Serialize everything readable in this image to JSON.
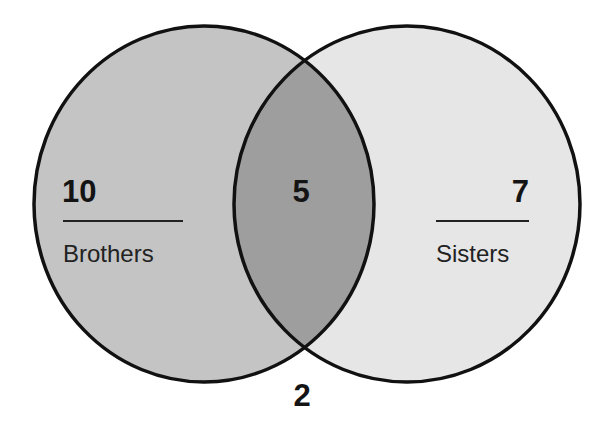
{
  "diagram": {
    "type": "venn",
    "sets": [
      {
        "id": "brothers",
        "label": "Brothers",
        "only_count": "10",
        "fill": "#c4c4c4"
      },
      {
        "id": "sisters",
        "label": "Sisters",
        "only_count": "7",
        "fill": "#e6e6e6"
      }
    ],
    "intersection": {
      "count": "5",
      "fill": "#9e9e9e"
    },
    "outside": {
      "count": "2"
    },
    "stroke_color": "#111111",
    "background": "#ffffff"
  }
}
